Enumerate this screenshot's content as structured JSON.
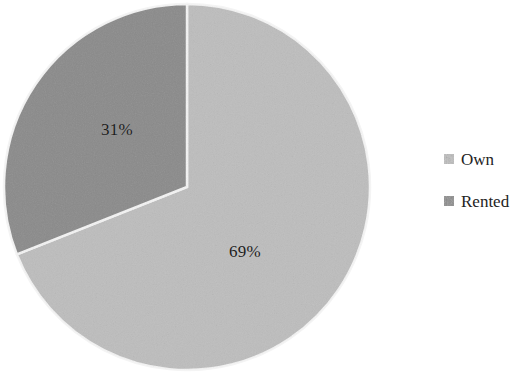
{
  "chart_data": {
    "type": "pie",
    "title": "",
    "categories": [
      "Own",
      "Rented"
    ],
    "values": [
      69,
      31
    ],
    "labels": [
      "69%",
      "31%"
    ],
    "units": "percent",
    "legend_position": "right",
    "grid": false,
    "start_angle_deg": 0,
    "direction": "clockwise",
    "series": [
      {
        "name": "Housing tenure",
        "slices": [
          {
            "name": "Own",
            "value": 69,
            "label": "69%",
            "color": "#bdbdbd"
          },
          {
            "name": "Rented",
            "value": 31,
            "label": "31%",
            "color": "#8a8a8a"
          }
        ]
      }
    ]
  },
  "legend": {
    "items": [
      {
        "label": "Own",
        "color": "#bdbdbd"
      },
      {
        "label": "Rented",
        "color": "#8a8a8a"
      }
    ]
  },
  "colors": {
    "own": "#bdbdbd",
    "rented": "#8a8a8a",
    "background": "#ffffff",
    "separator": "#f2f2f2",
    "label_text": "#1d1d1d",
    "legend_text": "#232323"
  }
}
